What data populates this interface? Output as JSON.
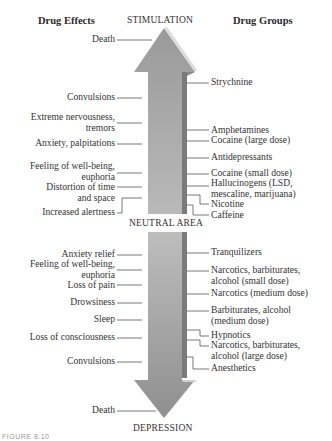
{
  "headers": {
    "left": "Drug Effects",
    "top": "STIMULATION",
    "right": "Drug Groups",
    "middle": "NEUTRAL AREA",
    "bottom": "DEPRESSION"
  },
  "stimulation": {
    "effects": [
      {
        "label": "Death"
      },
      {
        "label": "Convulsions"
      },
      {
        "label": "Extreme nervousness,\ntremors"
      },
      {
        "label": "Anxiety, palpitations"
      },
      {
        "label": "Feeling of well-being,\neuphoria"
      },
      {
        "label": "Distortion of time\nand space"
      },
      {
        "label": "Increased alertness"
      }
    ],
    "drug_groups": [
      {
        "label": "Strychnine"
      },
      {
        "label": "Amphetamines"
      },
      {
        "label": "Cocaine (large dose)"
      },
      {
        "label": "Antidepressants"
      },
      {
        "label": "Cocaine (small dose)"
      },
      {
        "label": "Hallucinogens (LSD,\nmescaline, marijuana)"
      },
      {
        "label": "Nicotine"
      },
      {
        "label": "Caffeine"
      }
    ]
  },
  "depression": {
    "effects": [
      {
        "label": "Anxiety relief"
      },
      {
        "label": "Feeling of well-being,\neuphoria"
      },
      {
        "label": "Loss of pain"
      },
      {
        "label": "Drowsiness"
      },
      {
        "label": "Sleep"
      },
      {
        "label": "Loss of consciousness"
      },
      {
        "label": "Convulsions"
      },
      {
        "label": "Death"
      }
    ],
    "drug_groups": [
      {
        "label": "Tranquilizers"
      },
      {
        "label": "Narcotics, barbiturates,\nalcohol (small dose)"
      },
      {
        "label": "Narcotics (medium dose)"
      },
      {
        "label": "Barbiturates, alcohol\n(medium dose)"
      },
      {
        "label": "Hypnotics"
      },
      {
        "label": "Narcotics, barbiturates,\nalcohol (large dose)"
      },
      {
        "label": "Anesthetics"
      }
    ]
  },
  "caption": "FIGURE 8.10",
  "colors": {
    "arrow_light": "#b8b8b8",
    "arrow_dark": "#8a8a8a",
    "arrow_side": "#6e6e6e",
    "leader_line": "#555555",
    "text": "#333333"
  }
}
